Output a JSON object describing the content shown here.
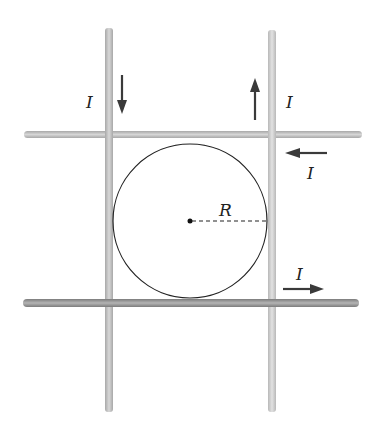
{
  "diagram": {
    "labels": {
      "current_left": "I",
      "current_right_vertical": "I",
      "current_top_horizontal": "I",
      "current_bottom_horizontal": "I",
      "radius": "R"
    },
    "wires": [
      {
        "name": "left-vertical",
        "direction": "down"
      },
      {
        "name": "right-vertical",
        "direction": "up"
      },
      {
        "name": "top-horizontal",
        "direction": "left"
      },
      {
        "name": "bottom-horizontal",
        "direction": "right"
      }
    ],
    "colors": {
      "wire_light": "#c8c8c8",
      "wire_dark": "#9a9a9a",
      "arrow": "#3a3a3a",
      "circle": "#222222"
    }
  }
}
